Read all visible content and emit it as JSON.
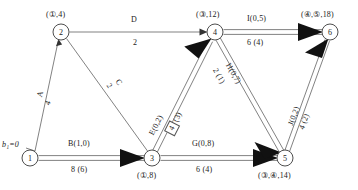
{
  "diagram": {
    "source_label": "b₁=0",
    "nodes": [
      {
        "id": "1",
        "num": "1",
        "x": 30,
        "y": 158,
        "r": 8,
        "label": "",
        "label_pos": "none"
      },
      {
        "id": "2",
        "num": "2",
        "x": 61,
        "y": 32,
        "r": 8,
        "label": "(①,4)",
        "label_pos": "above"
      },
      {
        "id": "3",
        "num": "3",
        "x": 152,
        "y": 158,
        "r": 8,
        "label": "(①,8)",
        "label_pos": "below"
      },
      {
        "id": "4",
        "num": "4",
        "x": 215,
        "y": 32,
        "r": 8,
        "label": "(③,12)",
        "label_pos": "above"
      },
      {
        "id": "5",
        "num": "5",
        "x": 285,
        "y": 158,
        "r": 8,
        "label": "(③,④,14)",
        "label_pos": "below"
      },
      {
        "id": "6",
        "num": "6",
        "x": 330,
        "y": 32,
        "r": 8,
        "label": "(④,⑤,18)",
        "label_pos": "above"
      }
    ],
    "edges": [
      {
        "id": "A",
        "from": "1",
        "to": "2",
        "style": "single",
        "arrow": "thin",
        "name": "A",
        "capacity_flow": "",
        "cost": "4",
        "name_label": "A",
        "value_label": "4",
        "rotated": true,
        "boxed": false
      },
      {
        "id": "B",
        "from": "1",
        "to": "3",
        "style": "double",
        "arrow": "solid",
        "name_label": "B(1,0)",
        "value_label": "8 (6)",
        "rotated": false,
        "boxed": false
      },
      {
        "id": "C",
        "from": "2",
        "to": "3",
        "style": "single",
        "arrow": "none",
        "name_label": "C",
        "value_label": "2",
        "rotated": true,
        "boxed": false
      },
      {
        "id": "D",
        "from": "2",
        "to": "4",
        "style": "single",
        "arrow": "thin",
        "name_label": "D",
        "value_label": "2",
        "rotated": false,
        "boxed": false
      },
      {
        "id": "E",
        "from": "3",
        "to": "4",
        "style": "double",
        "arrow": "solid",
        "name_label": "E(0,2)",
        "value_label": "4 (3)",
        "rotated": true,
        "boxed": true,
        "boxed_part": "4",
        "unboxed_part": "(3)"
      },
      {
        "id": "G",
        "from": "3",
        "to": "5",
        "style": "double",
        "arrow": "solid",
        "name_label": "G(0,8)",
        "value_label": "6 (4)",
        "rotated": false,
        "boxed": false
      },
      {
        "id": "H",
        "from": "4",
        "to": "5",
        "style": "double",
        "arrow": "solid",
        "name_label": "H(0,7)",
        "value_label": "2 (1)",
        "rotated": true,
        "boxed": false
      },
      {
        "id": "I",
        "from": "4",
        "to": "6",
        "style": "double",
        "arrow": "solid",
        "name_label": "I(0,5)",
        "value_label": "6 (4)",
        "rotated": false,
        "boxed": false
      },
      {
        "id": "J",
        "from": "5",
        "to": "6",
        "style": "double",
        "arrow": "solid",
        "name_label": "J(0,2)",
        "value_label": "4 (2)",
        "rotated": true,
        "boxed": false
      }
    ],
    "colors": {
      "line": "#6b6b6b",
      "node_stroke": "#3a3a3a",
      "arrow_solid": "#111111",
      "text": "#1a1a1a",
      "background": "#ffffff"
    }
  }
}
